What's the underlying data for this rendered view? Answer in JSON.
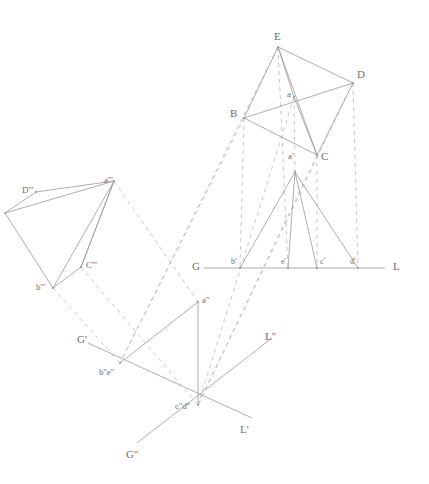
{
  "drawing": {
    "title": "Descriptive geometry: three projections of a pyramid",
    "stroke_solid": "#9a9a9a",
    "stroke_dashed": "#b9b9b9",
    "label_color": "#6e6e6e",
    "background": "#ffffff",
    "width": 429,
    "height": 484
  },
  "labels": {
    "plan": [
      {
        "id": "E",
        "text": "E",
        "x": 274,
        "y": 31,
        "size": "big"
      },
      {
        "id": "D",
        "text": "D",
        "x": 357,
        "y": 69,
        "size": "big"
      },
      {
        "id": "B",
        "text": "B",
        "x": 230,
        "y": 108,
        "size": "big"
      },
      {
        "id": "C",
        "text": "C",
        "x": 321,
        "y": 151,
        "size": "big"
      },
      {
        "id": "a",
        "text": "a",
        "x": 287,
        "y": 90,
        "size": "mid"
      }
    ],
    "elevation": [
      {
        "id": "a1",
        "text": "a'",
        "x": 288,
        "y": 152,
        "size": "mid"
      },
      {
        "id": "G",
        "text": "G",
        "x": 192,
        "y": 261,
        "size": "big"
      },
      {
        "id": "L",
        "text": "L",
        "x": 393,
        "y": 261,
        "size": "big"
      },
      {
        "id": "b1",
        "text": "b'",
        "x": 231,
        "y": 258,
        "size": "sm"
      },
      {
        "id": "e1",
        "text": "e'",
        "x": 281,
        "y": 258,
        "size": "sm"
      },
      {
        "id": "c1",
        "text": "c'",
        "x": 320,
        "y": 258,
        "size": "sm"
      },
      {
        "id": "d1",
        "text": "d'",
        "x": 350,
        "y": 258,
        "size": "sm"
      }
    ],
    "auxiliary_left": [
      {
        "id": "a3",
        "text": "a'''",
        "x": 104,
        "y": 176,
        "size": "mid"
      },
      {
        "id": "D3",
        "text": "D'''",
        "x": 22,
        "y": 186,
        "size": "mid"
      },
      {
        "id": "C3",
        "text": "C'''",
        "x": 86,
        "y": 261,
        "size": "mid"
      },
      {
        "id": "b3",
        "text": "b'''",
        "x": 36,
        "y": 283,
        "size": "mid"
      }
    ],
    "auxiliary_lower": [
      {
        "id": "a2",
        "text": "a''",
        "x": 202,
        "y": 296,
        "size": "mid"
      },
      {
        "id": "Gp",
        "text": "G'",
        "x": 77,
        "y": 334,
        "size": "big"
      },
      {
        "id": "Lpp",
        "text": "L''",
        "x": 265,
        "y": 331,
        "size": "big"
      },
      {
        "id": "b2e2",
        "text": "b''e''",
        "x": 99,
        "y": 368,
        "size": "mid"
      },
      {
        "id": "c2d2",
        "text": "c''d''",
        "x": 175,
        "y": 402,
        "size": "mid"
      },
      {
        "id": "Lp",
        "text": "L'",
        "x": 240,
        "y": 424,
        "size": "big"
      },
      {
        "id": "Gpp",
        "text": "G''",
        "x": 126,
        "y": 449,
        "size": "big"
      }
    ]
  },
  "geometry": {
    "points": {
      "E": [
        278,
        47
      ],
      "D": [
        353,
        83
      ],
      "B": [
        244,
        118
      ],
      "C": [
        317,
        155
      ],
      "a": [
        294,
        97
      ],
      "a_p": [
        295,
        172
      ],
      "b_p": [
        240,
        268
      ],
      "e_p": [
        288,
        268
      ],
      "c_p": [
        317,
        268
      ],
      "d_p": [
        358,
        268
      ],
      "G": [
        204,
        268
      ],
      "L": [
        385,
        268
      ],
      "a_3": [
        114,
        181
      ],
      "D_3": [
        36,
        192
      ],
      "C_3": [
        81,
        267
      ],
      "b_3": [
        53,
        288
      ],
      "x_3": [
        5,
        213
      ],
      "a_2": [
        198,
        302
      ],
      "b_2": [
        120,
        363
      ],
      "c_2": [
        198,
        405
      ],
      "G_p": [
        88,
        343
      ],
      "L_p": [
        252,
        418
      ],
      "G_pp": [
        137,
        443
      ],
      "L_pp": [
        272,
        338
      ]
    },
    "solid_edges": [
      [
        "E",
        "D"
      ],
      [
        "E",
        "B"
      ],
      [
        "E",
        "C"
      ],
      [
        "E",
        "a"
      ],
      [
        "B",
        "D"
      ],
      [
        "B",
        "C"
      ],
      [
        "D",
        "C"
      ],
      [
        "a",
        "C"
      ],
      [
        "a_p",
        "b_p"
      ],
      [
        "a_p",
        "c_p"
      ],
      [
        "a_p",
        "d_p"
      ],
      [
        "a_p",
        "e_p"
      ],
      [
        "G",
        "L"
      ],
      [
        "a_3",
        "D_3"
      ],
      [
        "a_3",
        "C_3"
      ],
      [
        "a_3",
        "b_3"
      ],
      [
        "a_3",
        "x_3"
      ],
      [
        "D_3",
        "x_3"
      ],
      [
        "x_3",
        "b_3"
      ],
      [
        "b_3",
        "C_3"
      ],
      [
        "C_3",
        "a_3"
      ],
      [
        "G_p",
        "L_p"
      ],
      [
        "G_pp",
        "L_pp"
      ],
      [
        "a_2",
        "b_2"
      ],
      [
        "a_2",
        "c_2"
      ]
    ],
    "dashed_edges": [
      [
        "E",
        "e_p"
      ],
      [
        "B",
        "b_p"
      ],
      [
        "C",
        "c_p"
      ],
      [
        "D",
        "d_p"
      ],
      [
        "a",
        "a_p"
      ],
      [
        "B",
        "b_2"
      ],
      [
        "E",
        "b_2"
      ],
      [
        "a",
        "c_2"
      ],
      [
        "C",
        "c_2"
      ],
      [
        "D",
        "c_2"
      ],
      [
        "a_3",
        "a_2"
      ],
      [
        "C_3",
        "c_2"
      ],
      [
        "b_3",
        "b_2"
      ]
    ]
  }
}
